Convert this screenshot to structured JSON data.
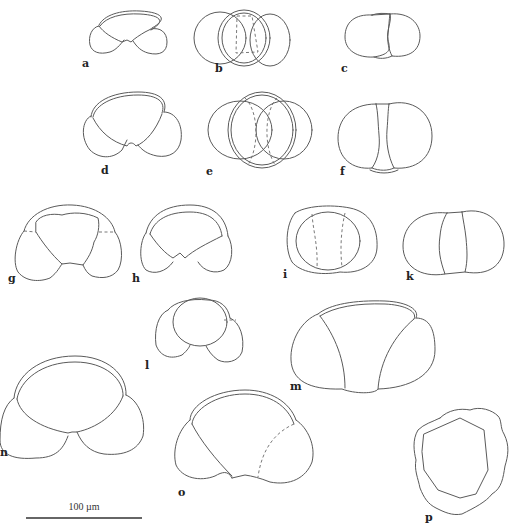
{
  "figure": {
    "panels": [
      {
        "id": "a",
        "label": "a",
        "view": "umbilical"
      },
      {
        "id": "b",
        "label": "b",
        "view": "spiral"
      },
      {
        "id": "c",
        "label": "c",
        "view": "side"
      },
      {
        "id": "d",
        "label": "d",
        "view": "umbilical"
      },
      {
        "id": "e",
        "label": "e",
        "view": "spiral"
      },
      {
        "id": "f",
        "label": "f",
        "view": "side"
      },
      {
        "id": "g",
        "label": "g",
        "view": "umbilical"
      },
      {
        "id": "h",
        "label": "h",
        "view": "umbilical"
      },
      {
        "id": "i",
        "label": "i",
        "view": "umbilical"
      },
      {
        "id": "k",
        "label": "k",
        "view": "spiral"
      },
      {
        "id": "l",
        "label": "l",
        "view": "side"
      },
      {
        "id": "m",
        "label": "m",
        "view": "umbilical"
      },
      {
        "id": "n",
        "label": "n",
        "view": "spiral"
      },
      {
        "id": "o",
        "label": "o",
        "view": "umbilical"
      },
      {
        "id": "p",
        "label": "p",
        "view": "polar"
      }
    ],
    "scale_bar": {
      "label": "100 µm",
      "value": 100,
      "unit": "µm"
    },
    "colors": {
      "line": "#5a5a5a",
      "label": "#222222",
      "background": "#ffffff"
    }
  }
}
